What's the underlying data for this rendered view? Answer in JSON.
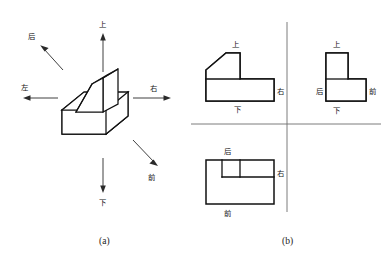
{
  "figure": {
    "panels": [
      {
        "id": "a",
        "caption": "(a)",
        "title_text": "(a)"
      },
      {
        "id": "b",
        "caption": "(b)",
        "title_text": "(b)"
      }
    ]
  },
  "panel_a": {
    "caption": "(a)",
    "object_name": "isometric-solid",
    "direction_arrows": [
      {
        "key": "up",
        "label": "上",
        "meaning": "top",
        "direction": "up"
      },
      {
        "key": "down",
        "label": "下",
        "meaning": "bottom",
        "direction": "down"
      },
      {
        "key": "left",
        "label": "左",
        "meaning": "left",
        "direction": "left"
      },
      {
        "key": "right",
        "label": "右",
        "meaning": "right",
        "direction": "right"
      },
      {
        "key": "back",
        "label": "后",
        "meaning": "back",
        "direction": "up-left"
      },
      {
        "key": "front",
        "label": "前",
        "meaning": "front",
        "direction": "down-right"
      }
    ]
  },
  "panel_b": {
    "caption": "(b)",
    "axis": {
      "name": "quadrant-cross",
      "color": "#6e6e6e"
    },
    "views": [
      {
        "key": "front-view",
        "quadrant": "top-left",
        "labels": {
          "top": "上",
          "right": "右",
          "bottom": "下"
        }
      },
      {
        "key": "side-view",
        "quadrant": "top-right",
        "labels": {
          "top": "上",
          "left": "后",
          "right": "前",
          "bottom": "下"
        }
      },
      {
        "key": "top-view",
        "quadrant": "bottom-left",
        "labels": {
          "top": "后",
          "right": "右",
          "bottom": "前"
        }
      }
    ]
  },
  "colors": {
    "line": "#111111",
    "axis": "#6e6e6e",
    "arrow": "#2a2a2a",
    "background": "#ffffff"
  }
}
